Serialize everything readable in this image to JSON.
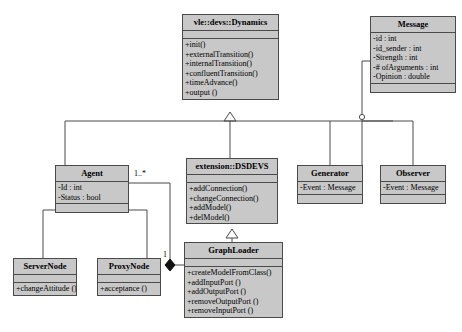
{
  "diagram": {
    "kind": "uml-class-diagram",
    "background": "#ffffff",
    "box_fill": "#c8c8c8",
    "line_color": "#4a4a4a",
    "classes": [
      {
        "id": "dynamics",
        "name": "vle::devs::Dynamics",
        "attributes": [],
        "operations": [
          "+init()",
          "+externalTransition()",
          "+internalTransition()",
          "+confluentTransition()",
          "+timeAdvance()",
          "+output ()"
        ]
      },
      {
        "id": "message",
        "name": "Message",
        "attributes": [
          "-id : int",
          "-id_sender : int",
          "-Strength : int",
          "-# ofArguments : int",
          "-Opinion : double"
        ],
        "operations": []
      },
      {
        "id": "agent",
        "name": "Agent",
        "attributes": [
          "-Id : int",
          "-Status : bool"
        ],
        "operations": []
      },
      {
        "id": "dsdevs",
        "name": "extension::DSDEVS",
        "attributes": [],
        "operations": [
          "+addConnection()",
          "+changeConnection()",
          "+addModel()",
          "+delModel()"
        ]
      },
      {
        "id": "generator",
        "name": "Generator",
        "attributes": [
          "-Event : Message"
        ],
        "operations": []
      },
      {
        "id": "observer",
        "name": "Observer",
        "attributes": [
          "-Event : Message"
        ],
        "operations": []
      },
      {
        "id": "graphloader",
        "name": "GraphLoader",
        "attributes": [],
        "operations": [
          "+createModelFromClass()",
          "+addInputPort ()",
          "+addOutputPort ()",
          "+removeOutputPort ()",
          "+removeInputPort ()"
        ]
      },
      {
        "id": "servernode",
        "name": "ServerNode",
        "attributes": [],
        "operations": [
          "+changeAttitude ()"
        ]
      },
      {
        "id": "proxynode",
        "name": "ProxyNode",
        "attributes": [],
        "operations": [
          "+acceptance ()"
        ]
      }
    ],
    "multiplicities": [
      {
        "id": "agent-many",
        "text": "1..*"
      },
      {
        "id": "graphloader-one",
        "text": "1"
      }
    ]
  }
}
